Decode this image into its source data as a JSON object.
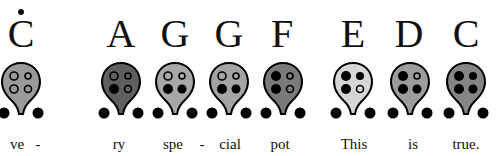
{
  "notes": [
    {
      "letter": "C",
      "octave_dot": true,
      "fill": "#9a9a9a",
      "x": 21,
      "holes": {
        "tl": "open",
        "tr": "open",
        "bl": "open",
        "br": "open"
      }
    },
    {
      "letter": "A",
      "octave_dot": false,
      "fill": "#5f5f5f",
      "x": 121,
      "holes": {
        "tl": "open",
        "tr": "open",
        "bl": "closed",
        "br": "open"
      }
    },
    {
      "letter": "G",
      "octave_dot": false,
      "fill": "#a8a8a8",
      "x": 175,
      "holes": {
        "tl": "open",
        "tr": "open",
        "bl": "closed",
        "br": "closed"
      }
    },
    {
      "letter": "G",
      "octave_dot": false,
      "fill": "#a4a4a4",
      "x": 229,
      "holes": {
        "tl": "open",
        "tr": "open",
        "bl": "closed",
        "br": "closed"
      }
    },
    {
      "letter": "F",
      "octave_dot": false,
      "fill": "#7a7a7a",
      "x": 283,
      "holes": {
        "tl": "closed",
        "tr": "open",
        "bl": "closed",
        "br": "open"
      }
    },
    {
      "letter": "E",
      "octave_dot": false,
      "fill": "#d6d6d6",
      "x": 353,
      "holes": {
        "tl": "closed",
        "tr": "closed",
        "bl": "closed",
        "br": "open"
      }
    },
    {
      "letter": "D",
      "octave_dot": false,
      "fill": "#9c9c9c",
      "x": 410,
      "holes": {
        "tl": "closed",
        "tr": "open",
        "bl": "closed",
        "br": "closed"
      }
    },
    {
      "letter": "C",
      "octave_dot": false,
      "fill": "#858585",
      "x": 466,
      "holes": {
        "tl": "closed",
        "tr": "closed",
        "bl": "closed",
        "br": "closed"
      }
    }
  ],
  "lyrics": [
    {
      "text": "ve",
      "x": 17
    },
    {
      "text": "-",
      "x": 38
    },
    {
      "text": "ry",
      "x": 119
    },
    {
      "text": "spe",
      "x": 173
    },
    {
      "text": "-",
      "x": 202
    },
    {
      "text": "cial",
      "x": 230
    },
    {
      "text": "pot",
      "x": 280
    },
    {
      "text": "This",
      "x": 354
    },
    {
      "text": "is",
      "x": 413
    },
    {
      "text": "true.",
      "x": 466
    }
  ]
}
